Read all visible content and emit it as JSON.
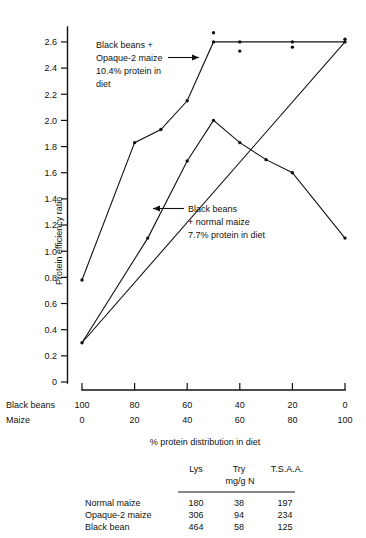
{
  "chart_data": {
    "type": "line",
    "title": "",
    "xlabel": "% protein distribution in diet",
    "ylabel": "Protein efficiency ratio",
    "ylim": [
      0,
      2.7
    ],
    "yticks": [
      "0",
      "0.2",
      "0.4",
      "0.6",
      "0.8",
      "1.0",
      "1.2",
      "1.4",
      "1.6",
      "1.8",
      "2.0",
      "2.2",
      "2.4",
      "2.6"
    ],
    "ytick_values": [
      0,
      0.2,
      0.4,
      0.6,
      0.8,
      1.0,
      1.2,
      1.4,
      1.6,
      1.8,
      2.0,
      2.2,
      2.4,
      2.6
    ],
    "x_axis_rows": [
      {
        "name": "Black beans",
        "values": [
          "100",
          "80",
          "60",
          "40",
          "20",
          "0"
        ]
      },
      {
        "name": "Maize",
        "values": [
          "0",
          "20",
          "40",
          "60",
          "80",
          "100"
        ]
      }
    ],
    "x_positions": [
      100,
      80,
      60,
      40,
      20,
      0
    ],
    "grid": false,
    "legend": "annotations",
    "series": [
      {
        "name": "Black beans + Opaque-2 maize, 10.4% protein in diet",
        "x": [
          100,
          80,
          70,
          60,
          50,
          40,
          20,
          0
        ],
        "values": [
          0.78,
          1.83,
          1.93,
          2.15,
          2.6,
          2.6,
          2.6,
          2.6
        ]
      },
      {
        "name": "Black beans + normal maize, 7.7% protein in diet",
        "x": [
          100,
          75,
          60,
          50,
          40,
          30,
          20,
          0
        ],
        "values": [
          0.3,
          1.1,
          1.69,
          2.0,
          1.83,
          1.7,
          1.6,
          1.1
        ]
      },
      {
        "name": "baseline",
        "x": [
          100,
          0
        ],
        "values": [
          0.3,
          2.6
        ]
      }
    ],
    "scatter_points": [
      {
        "x": 50,
        "y": 2.67
      },
      {
        "x": 40,
        "y": 2.53
      },
      {
        "x": 20,
        "y": 2.56
      },
      {
        "x": 0,
        "y": 2.62
      }
    ],
    "annotations": [
      {
        "id": "opaque2",
        "lines": [
          "Black beans +",
          "Opaque-2 maize",
          "10.4% protein in",
          "diet"
        ],
        "arrow": "right"
      },
      {
        "id": "normal",
        "lines": [
          "Black beans",
          "+ normal maize",
          "7.7% protein in diet"
        ],
        "arrow": "left"
      }
    ]
  },
  "data_table": {
    "col_headers": [
      "Lys",
      "Try",
      "T.S.A.A."
    ],
    "units": "mg/g N",
    "rows": [
      {
        "label": "Normal maize",
        "cells": [
          "180",
          "38",
          "197"
        ]
      },
      {
        "label": "Opaque-2 maize",
        "cells": [
          "306",
          "94",
          "234"
        ]
      },
      {
        "label": "Black bean",
        "cells": [
          "464",
          "58",
          "125"
        ]
      }
    ]
  },
  "colors": {
    "ink": "#111111",
    "paper": "#ffffff"
  }
}
